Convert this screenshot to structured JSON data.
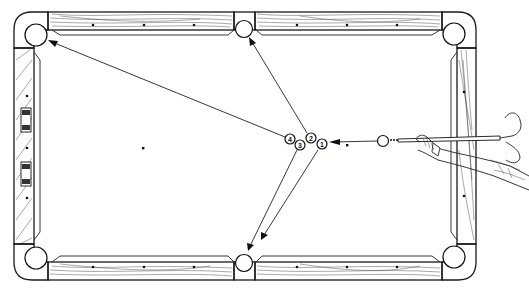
{
  "diagram": {
    "title": "",
    "colors": {
      "line": "#1a1a1a",
      "background": "#ffffff"
    },
    "object_balls": [
      {
        "label": "1",
        "x": 322,
        "y": 144
      },
      {
        "label": "2",
        "x": 311,
        "y": 138
      },
      {
        "label": "3",
        "x": 300,
        "y": 145
      },
      {
        "label": "4",
        "x": 290,
        "y": 139
      }
    ],
    "cue_ball": {
      "x": 383,
      "y": 141
    },
    "spots": [
      {
        "name": "head-spot",
        "x": 143,
        "y": 148
      },
      {
        "name": "foot-spot",
        "x": 347,
        "y": 145
      }
    ],
    "paths": [
      {
        "from": "ball-4",
        "to": "top-left-pocket"
      },
      {
        "from": "ball-2",
        "to": "top-side-pocket"
      },
      {
        "from": "ball-3",
        "to": "bottom-side-pocket"
      },
      {
        "from": "ball-1",
        "to": "bottom-side-pocket"
      },
      {
        "from": "cue-ball",
        "to": "ball-1"
      }
    ]
  }
}
